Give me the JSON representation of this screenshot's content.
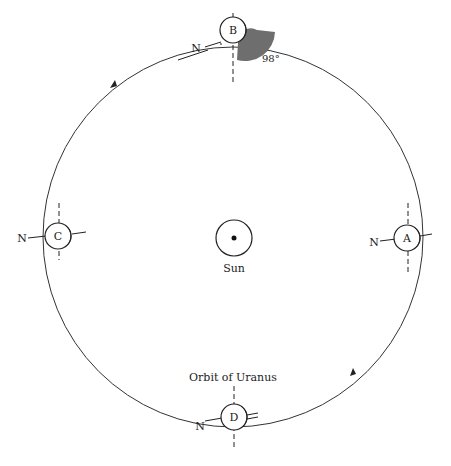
{
  "header_fragment": "",
  "sun": {
    "label": "Sun"
  },
  "orbit": {
    "label": "Orbit of Uranus"
  },
  "positions": [
    {
      "id": "A",
      "label": "A",
      "north": "N"
    },
    {
      "id": "B",
      "label": "B",
      "north": "N"
    },
    {
      "id": "C",
      "label": "C",
      "north": "N"
    },
    {
      "id": "D",
      "label": "D",
      "north": "N"
    }
  ],
  "tilt_angle": "98°",
  "colors": {
    "line": "#222222",
    "shade": "#6e6e6e"
  }
}
